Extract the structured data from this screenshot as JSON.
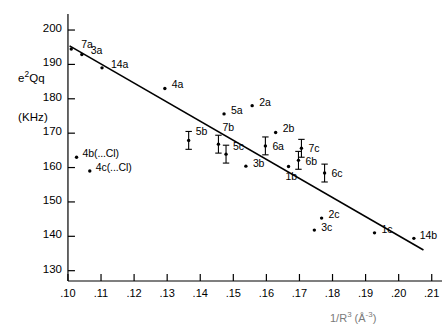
{
  "chart_data": {
    "type": "scatter",
    "title": "",
    "xlabel": "1/R3 (A-3)",
    "xlabel_display": "1/R³ (Å⁻³)",
    "ylabel": "e2Qq",
    "ylabel_display": "e²Qq",
    "ylabel_units": "(KHz)",
    "xlim": [
      0.0985,
      0.2125
    ],
    "ylim": [
      127.0,
      203.5
    ],
    "xticks": [
      0.1,
      0.11,
      0.12,
      0.13,
      0.14,
      0.15,
      0.16,
      0.17,
      0.18,
      0.19,
      0.2,
      0.21
    ],
    "xticklabels": [
      ".10",
      ".11",
      ".12",
      ".13",
      ".14",
      ".15",
      ".16",
      ".17",
      ".18",
      ".19",
      ".20",
      ".21"
    ],
    "yticks": [
      130,
      140,
      150,
      160,
      170,
      180,
      190,
      200
    ],
    "yticklabels": [
      "130",
      "140",
      "150",
      "160",
      "170",
      "180",
      "190",
      "200"
    ],
    "grid": false,
    "legend": "none",
    "marker_color": "#000000",
    "line_color": "#000000",
    "trendline": {
      "x0": 0.1005,
      "y0": 195.4,
      "x1": 0.2075,
      "y1": 136.0
    },
    "points": [
      {
        "id": "7a",
        "label": "7a",
        "x": 0.101,
        "y": 194.5,
        "err": 0,
        "lx": 10,
        "ly": -11
      },
      {
        "id": "3a",
        "label": "3a",
        "x": 0.1042,
        "y": 192.9,
        "err": 0,
        "lx": 9,
        "ly": -10
      },
      {
        "id": "14a",
        "label": "14a",
        "x": 0.1103,
        "y": 189.0,
        "err": 0,
        "lx": 9,
        "ly": -10
      },
      {
        "id": "4a",
        "label": "4a",
        "x": 0.1293,
        "y": 183.0,
        "err": 0,
        "lx": 7,
        "ly": -10
      },
      {
        "id": "5a",
        "label": "5a",
        "x": 0.1472,
        "y": 175.6,
        "err": 0,
        "lx": 7,
        "ly": -10
      },
      {
        "id": "4b(...Cl)",
        "label": "4b(...Cl)",
        "x": 0.1026,
        "y": 163.0,
        "err": 0,
        "lx": 6,
        "ly": -10
      },
      {
        "id": "4c(...Cl)",
        "label": "4c(...Cl)",
        "x": 0.1066,
        "y": 159.0,
        "err": 0,
        "lx": 6,
        "ly": -10
      },
      {
        "id": "5b",
        "label": "5b",
        "x": 0.1365,
        "y": 167.9,
        "err": 2.6,
        "lx": 7,
        "ly": -15
      },
      {
        "id": "7b",
        "label": "7b",
        "x": 0.1455,
        "y": 166.8,
        "err": 2.6,
        "lx": 4,
        "ly": -23
      },
      {
        "id": "5c",
        "label": "5c",
        "x": 0.1478,
        "y": 163.9,
        "err": 2.6,
        "lx": 7,
        "ly": -14
      },
      {
        "id": "3b",
        "label": "3b",
        "x": 0.1538,
        "y": 160.4,
        "err": 0,
        "lx": 7,
        "ly": -9
      },
      {
        "id": "2a",
        "label": "2a",
        "x": 0.1557,
        "y": 178.0,
        "err": 0,
        "lx": 7,
        "ly": -10
      },
      {
        "id": "6a",
        "label": "6a",
        "x": 0.1597,
        "y": 166.3,
        "err": 2.6,
        "lx": 7,
        "ly": -6
      },
      {
        "id": "2b",
        "label": "2b",
        "x": 0.1628,
        "y": 170.2,
        "err": 0,
        "lx": 7,
        "ly": -10
      },
      {
        "id": "1b",
        "label": "1b",
        "x": 0.1667,
        "y": 160.3,
        "err": 0,
        "lx": -3,
        "ly": 3
      },
      {
        "id": "6b",
        "label": "6b",
        "x": 0.1697,
        "y": 162.1,
        "err": 2.6,
        "lx": 7,
        "ly": -5
      },
      {
        "id": "7c",
        "label": "7c",
        "x": 0.1706,
        "y": 165.6,
        "err": 2.6,
        "lx": 7,
        "ly": -6
      },
      {
        "id": "6c",
        "label": "6c",
        "x": 0.1776,
        "y": 158.4,
        "err": 2.6,
        "lx": 7,
        "ly": -6
      },
      {
        "id": "3c",
        "label": "3c",
        "x": 0.1745,
        "y": 141.8,
        "err": 0,
        "lx": 7,
        "ly": -9
      },
      {
        "id": "2c",
        "label": "2c",
        "x": 0.1767,
        "y": 145.3,
        "err": 0,
        "lx": 7,
        "ly": -10
      },
      {
        "id": "1c",
        "label": "1c",
        "x": 0.1927,
        "y": 141.0,
        "err": 0,
        "lx": 7,
        "ly": -10
      },
      {
        "id": "14b",
        "label": "14b",
        "x": 0.2046,
        "y": 139.4,
        "err": 0,
        "lx": 6,
        "ly": -9
      }
    ]
  }
}
